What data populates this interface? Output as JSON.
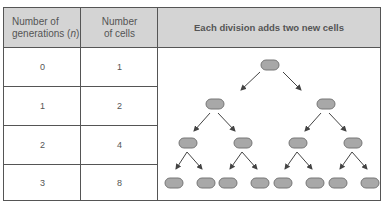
{
  "table": {
    "headers": {
      "generations": "Number of generations (n)",
      "generations_line1": "Number of",
      "generations_line2_prefix": "generations (",
      "generations_var": "n",
      "generations_line2_suffix": ")",
      "cells_line1": "Number",
      "cells_line2": "of cells",
      "diagram": "Each division adds two new cells"
    },
    "rows": [
      {
        "generations": "0",
        "cells": "1"
      },
      {
        "generations": "1",
        "cells": "2"
      },
      {
        "generations": "2",
        "cells": "4"
      },
      {
        "generations": "3",
        "cells": "8"
      }
    ]
  },
  "colors": {
    "header_bg": "#d4d4d4",
    "border": "#555555",
    "cell_fill": "#a8a8a8",
    "cell_stroke": "#777777",
    "arrow": "#444444"
  },
  "diagram": {
    "type": "binary-cell-division-tree",
    "levels": [
      {
        "generation": 0,
        "cell_count": 1
      },
      {
        "generation": 1,
        "cell_count": 2
      },
      {
        "generation": 2,
        "cell_count": 4
      },
      {
        "generation": 3,
        "cell_count": 8
      }
    ]
  }
}
